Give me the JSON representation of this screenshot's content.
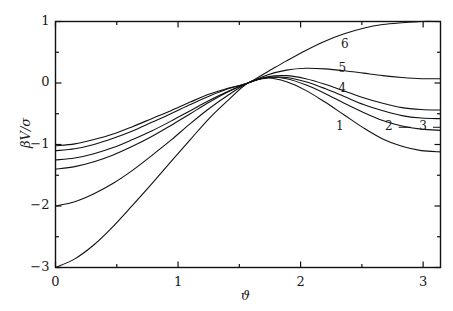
{
  "chart_data": {
    "type": "line",
    "title": "",
    "subtitle": "",
    "xlabel": "ϑ",
    "ylabel": "βV/σ",
    "xlim": [
      0,
      3.1416
    ],
    "ylim": [
      -3,
      1
    ],
    "grid": false,
    "legend_position": "inline-curve-labels",
    "x_ticks_major": [
      0,
      1,
      2,
      3
    ],
    "x_tick_labels": [
      "0",
      "1",
      "2",
      "3"
    ],
    "x_ticks_minor": [
      0.5,
      1.5,
      2.5
    ],
    "y_ticks_major": [
      1,
      0,
      -1,
      -2,
      -3
    ],
    "y_tick_labels": [
      "1",
      "0",
      "−1",
      "−2",
      "−3"
    ],
    "y_ticks_minor": [
      0.5,
      -0.5,
      -1.5,
      -2.5
    ],
    "convergence_point": [
      1.5708,
      0
    ],
    "annotations": [
      {
        "text": "6",
        "x": 2.36,
        "y": 0.62
      },
      {
        "text": "5",
        "x": 2.34,
        "y": 0.23
      },
      {
        "text": "4",
        "x": 2.34,
        "y": -0.1
      },
      {
        "text": "1",
        "x": 2.32,
        "y": -0.72
      },
      {
        "text": "2",
        "x": 2.72,
        "y": -0.72
      },
      {
        "text": "3",
        "x": 3.0,
        "y": -0.72
      }
    ],
    "series": [
      {
        "name": "1",
        "label": "1",
        "x": [
          0.0,
          0.157,
          0.314,
          0.471,
          0.628,
          0.785,
          0.942,
          1.1,
          1.257,
          1.414,
          1.571,
          1.728,
          1.885,
          2.042,
          2.199,
          2.356,
          2.513,
          2.67,
          2.827,
          2.985,
          3.142
        ],
        "y": [
          -3.0,
          -2.86,
          -2.63,
          -2.33,
          -1.99,
          -1.64,
          -1.28,
          -0.92,
          -0.57,
          -0.27,
          0.0,
          0.08,
          0.02,
          -0.12,
          -0.31,
          -0.52,
          -0.73,
          -0.91,
          -1.03,
          -1.1,
          -1.12
        ]
      },
      {
        "name": "2",
        "label": "2",
        "x": [
          0.0,
          0.157,
          0.314,
          0.471,
          0.628,
          0.785,
          0.942,
          1.1,
          1.257,
          1.414,
          1.571,
          1.728,
          1.885,
          2.042,
          2.199,
          2.356,
          2.513,
          2.67,
          2.827,
          2.985,
          3.142
        ],
        "y": [
          -2.0,
          -1.93,
          -1.8,
          -1.63,
          -1.42,
          -1.18,
          -0.93,
          -0.66,
          -0.41,
          -0.19,
          0.0,
          0.09,
          0.07,
          -0.03,
          -0.17,
          -0.33,
          -0.48,
          -0.61,
          -0.7,
          -0.75,
          -0.77
        ]
      },
      {
        "name": "3",
        "label": "3",
        "x": [
          0.0,
          0.157,
          0.314,
          0.471,
          0.628,
          0.785,
          0.942,
          1.1,
          1.257,
          1.414,
          1.571,
          1.728,
          1.885,
          2.042,
          2.199,
          2.356,
          2.513,
          2.67,
          2.827,
          2.985,
          3.142
        ],
        "y": [
          -1.4,
          -1.36,
          -1.28,
          -1.17,
          -1.03,
          -0.87,
          -0.69,
          -0.5,
          -0.31,
          -0.14,
          0.0,
          0.09,
          0.09,
          0.02,
          -0.09,
          -0.22,
          -0.35,
          -0.45,
          -0.53,
          -0.57,
          -0.58
        ]
      },
      {
        "name": "4",
        "label": "4",
        "x": [
          0.0,
          0.157,
          0.314,
          0.471,
          0.628,
          0.785,
          0.942,
          1.1,
          1.257,
          1.414,
          1.571,
          1.728,
          1.885,
          2.042,
          2.199,
          2.356,
          2.513,
          2.67,
          2.827,
          2.985,
          3.142
        ],
        "y": [
          -1.25,
          -1.22,
          -1.15,
          -1.05,
          -0.92,
          -0.78,
          -0.62,
          -0.45,
          -0.28,
          -0.13,
          0.0,
          0.1,
          0.12,
          0.07,
          -0.02,
          -0.13,
          -0.24,
          -0.33,
          -0.4,
          -0.43,
          -0.44
        ]
      },
      {
        "name": "5",
        "label": "5",
        "x": [
          0.0,
          0.157,
          0.314,
          0.471,
          0.628,
          0.785,
          0.942,
          1.1,
          1.257,
          1.414,
          1.571,
          1.728,
          1.885,
          2.042,
          2.199,
          2.356,
          2.513,
          2.67,
          2.827,
          2.985,
          3.142
        ],
        "y": [
          -1.1,
          -1.07,
          -1.0,
          -0.9,
          -0.78,
          -0.64,
          -0.5,
          -0.35,
          -0.21,
          -0.09,
          0.0,
          0.13,
          0.21,
          0.24,
          0.23,
          0.2,
          0.16,
          0.12,
          0.09,
          0.07,
          0.07
        ]
      },
      {
        "name": "6",
        "label": "6",
        "x": [
          0.0,
          0.157,
          0.314,
          0.471,
          0.628,
          0.785,
          0.942,
          1.1,
          1.257,
          1.414,
          1.571,
          1.728,
          1.885,
          2.042,
          2.199,
          2.356,
          2.513,
          2.67,
          2.827,
          2.985,
          3.142
        ],
        "y": [
          -1.02,
          -0.99,
          -0.92,
          -0.83,
          -0.71,
          -0.58,
          -0.45,
          -0.31,
          -0.18,
          -0.08,
          0.0,
          0.18,
          0.36,
          0.53,
          0.68,
          0.8,
          0.89,
          0.95,
          0.98,
          1.0,
          1.0
        ]
      }
    ],
    "style": {
      "line_color": "#111111",
      "line_width": 1.1,
      "axis_color": "#111111",
      "background": "#ffffff"
    }
  }
}
